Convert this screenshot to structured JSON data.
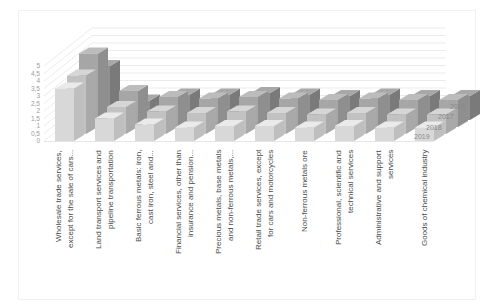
{
  "chart_data": {
    "type": "bar",
    "projection": "3d-column",
    "title": "",
    "xlabel": "",
    "ylabel": "",
    "ylim": [
      0,
      5
    ],
    "ytick_step": 0.5,
    "ytick_labels": [
      "0",
      "0,5",
      "1",
      "1,5",
      "2",
      "2,5",
      "3",
      "3,5",
      "4",
      "4,5",
      "5"
    ],
    "grid": true,
    "legend_position": "depth-axis-right",
    "categories": [
      "Wholesale trade services,\nexcept for the sale of cars...",
      "Land transport services and\npipeline transportation",
      "Basic ferrous metals: iron,\ncast iron, steel and...",
      "Financial services, other than\ninsurance and pension...",
      "Precious metals, base metals\nand non-ferrous metals,...",
      "Retail trade services, except\nfor cars and motorcycles",
      "Non-ferrous metals ore",
      "Professional, scientific and\ntechnical services",
      "Administrative and support\nservices",
      "Goods of chemical industry"
    ],
    "series": [
      {
        "name": "2016",
        "values": [
          3.6,
          1.3,
          1.7,
          1.7,
          1.8,
          1.7,
          1.6,
          1.7,
          1.6,
          1.6
        ]
      },
      {
        "name": "2017",
        "values": [
          4.9,
          2.4,
          2.0,
          1.9,
          2.0,
          1.9,
          1.8,
          1.9,
          1.8,
          1.8
        ]
      },
      {
        "name": "2018",
        "values": [
          3.9,
          1.8,
          1.5,
          1.4,
          1.5,
          1.4,
          1.3,
          1.4,
          1.3,
          1.3
        ]
      },
      {
        "name": "2019",
        "values": [
          3.5,
          1.5,
          1.1,
          0.9,
          1.0,
          1.0,
          0.9,
          1.0,
          0.9,
          0.9
        ]
      }
    ],
    "depth_axis_labels": [
      "2016",
      "2017",
      "2018",
      "2019"
    ]
  },
  "colors": {
    "background": "#ffffff",
    "gridline": "#e4e4e4",
    "baseline": "#dddddd",
    "tick_text": "#9b9b9b",
    "category_text": "#4a4a4a",
    "year_text": "#8a8a8a",
    "series_faces": {
      "2016": {
        "front": "#909090",
        "top": "#a8a8a8",
        "side": "#7a7a7a"
      },
      "2017": {
        "front": "#a6a6a6",
        "top": "#bcbcbc",
        "side": "#8f8f8f"
      },
      "2018": {
        "front": "#c2c2c2",
        "top": "#d6d6d6",
        "side": "#a9a9a9"
      },
      "2019": {
        "front": "#d8d8d8",
        "top": "#eaeaea",
        "side": "#bfbfbf"
      }
    }
  }
}
